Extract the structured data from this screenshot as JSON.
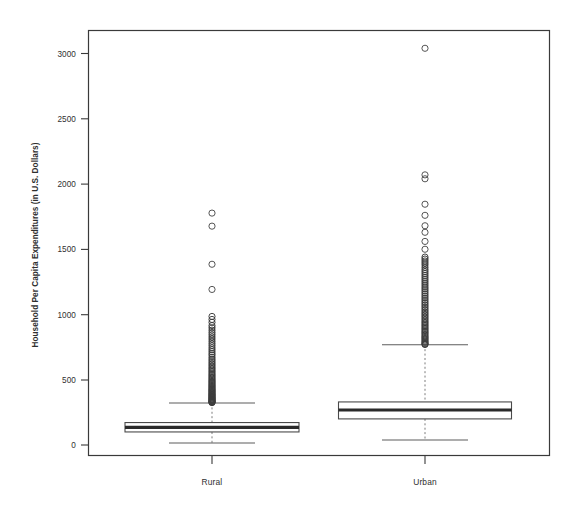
{
  "chart_data": {
    "type": "box",
    "title": "",
    "subtitle": "",
    "xlabel": "",
    "ylabel": "Household Per Capita Expenditures (in U.S. Dollars)",
    "categories": [
      "Rural",
      "Urban"
    ],
    "ylim": [
      0,
      3250
    ],
    "yticks": [
      0,
      500,
      1000,
      1500,
      2000,
      2500,
      3000
    ],
    "ytick_labels": [
      "0",
      "500",
      "1000",
      "1500",
      "2000",
      "2500",
      "3000"
    ],
    "grid": false,
    "legend": "none",
    "series": [
      {
        "name": "Rural",
        "whisker_low": 15,
        "q1": 100,
        "median": 135,
        "q3": 172,
        "whisker_high": 322,
        "outliers": [
          1777,
          1677,
          1385,
          1192,
          985,
          962,
          940,
          915,
          898,
          880,
          862,
          845,
          828,
          812,
          795,
          778,
          762,
          745,
          730,
          715,
          700,
          688,
          672,
          658,
          645,
          632,
          620,
          608,
          596,
          585,
          574,
          563,
          552,
          542,
          532,
          522,
          513,
          504,
          495,
          487,
          479,
          471,
          463,
          456,
          449,
          442,
          435,
          428,
          422,
          416,
          410,
          404,
          398,
          392,
          387,
          382,
          377,
          372,
          367,
          362,
          358,
          353,
          349,
          345,
          341,
          337,
          333,
          330,
          327,
          325
        ]
      },
      {
        "name": "Urban",
        "whisker_low": 38,
        "q1": 200,
        "median": 268,
        "q3": 330,
        "whisker_high": 768,
        "outliers": [
          3040,
          2070,
          2040,
          1845,
          1760,
          1680,
          1630,
          1560,
          1500,
          1440,
          1425,
          1410,
          1395,
          1380,
          1362,
          1345,
          1330,
          1315,
          1300,
          1285,
          1270,
          1255,
          1240,
          1225,
          1210,
          1196,
          1182,
          1168,
          1154,
          1140,
          1126,
          1112,
          1098,
          1085,
          1072,
          1059,
          1046,
          1033,
          1020,
          1008,
          996,
          984,
          972,
          960,
          948,
          937,
          926,
          915,
          904,
          893,
          882,
          872,
          862,
          852,
          842,
          832,
          823,
          814,
          805,
          796,
          788,
          780,
          774,
          770
        ]
      }
    ]
  },
  "axis": {
    "y_title": "Household Per Capita Expenditures (in U.S. Dollars)",
    "tick_0": "0",
    "tick_500": "500",
    "tick_1000": "1000",
    "tick_1500": "1500",
    "tick_2000": "2000",
    "tick_2500": "2500",
    "tick_3000": "3000",
    "cat_rural": "Rural",
    "cat_urban": "Urban"
  },
  "style": {
    "background": "#ffffff",
    "ink": "#3a3a3a",
    "median_color": "#2a2a2a",
    "outlier_color": "#4d4d4d",
    "whisker_color": "#7d7d7d"
  }
}
